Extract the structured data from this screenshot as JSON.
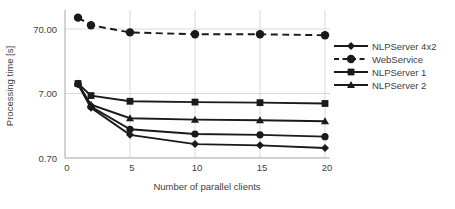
{
  "chart_data": {
    "type": "line",
    "title": "",
    "xlabel": "Number of parallel clients",
    "ylabel": "Processing time [s]",
    "y_scale": "log",
    "ylim": [
      0.7,
      140
    ],
    "xlim": [
      0,
      20.5
    ],
    "grid": true,
    "legend_position": "right",
    "y_ticks": [
      {
        "label": "70.00",
        "value": 70
      },
      {
        "label": "7.00",
        "value": 7
      },
      {
        "label": "0.70",
        "value": 0.7
      }
    ],
    "x_ticks": [
      {
        "label": "0",
        "value": 0
      },
      {
        "label": "5",
        "value": 5
      },
      {
        "label": "10",
        "value": 10
      },
      {
        "label": "15",
        "value": 15
      },
      {
        "label": "20",
        "value": 20
      }
    ],
    "x": [
      1,
      2,
      5,
      10,
      15,
      20
    ],
    "series": [
      {
        "name": "NLPServer 4x2",
        "marker": "diamond",
        "dashed": false,
        "in_legend": true,
        "values": [
          9.7,
          4.2,
          1.6,
          1.15,
          1.1,
          1.0
        ]
      },
      {
        "name": "WebService",
        "marker": "circle",
        "dashed": true,
        "in_legend": true,
        "values": [
          105,
          80,
          62,
          58,
          58,
          56
        ]
      },
      {
        "name": "NLPServer 1",
        "marker": "square",
        "dashed": false,
        "in_legend": true,
        "values": [
          10,
          6.5,
          5.3,
          5.15,
          5.05,
          4.9
        ]
      },
      {
        "name": "NLPServer 2",
        "marker": "triangle",
        "dashed": false,
        "in_legend": true,
        "values": [
          10,
          4.7,
          2.9,
          2.75,
          2.7,
          2.6
        ]
      },
      {
        "name": "",
        "marker": "circle",
        "dashed": false,
        "in_legend": false,
        "values": [
          9.8,
          4.4,
          1.95,
          1.65,
          1.6,
          1.5
        ]
      }
    ],
    "colors": {
      "line": "#1a1a1a",
      "grid": "#d9d9d9",
      "axis": "#a6a6a6",
      "text": "#404040",
      "background": "#ffffff"
    }
  }
}
